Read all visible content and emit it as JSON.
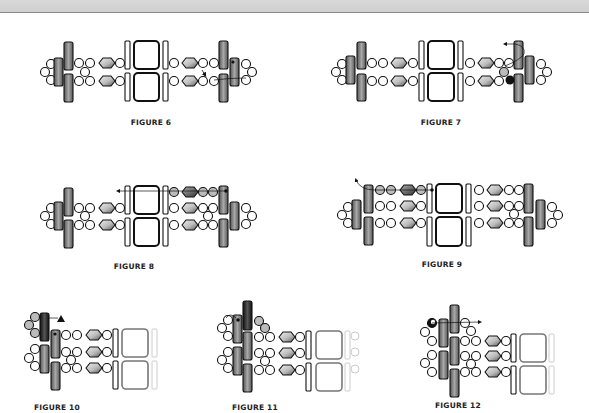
{
  "page": {
    "header_bar": "",
    "figures": [
      {
        "id": 6,
        "label": "FIGURE 6"
      },
      {
        "id": 7,
        "label": "FIGURE 7"
      },
      {
        "id": 8,
        "label": "FIGURE 8"
      },
      {
        "id": 9,
        "label": "FIGURE 9"
      },
      {
        "id": 10,
        "label": "FIGURE 10"
      },
      {
        "id": 11,
        "label": "FIGURE 11"
      },
      {
        "id": 12,
        "label": "FIGURE 12"
      }
    ]
  },
  "colors": {
    "bead_outline": "#111111",
    "tube_dark": "#4a4a4a",
    "tube_mid": "#8c8c8c",
    "highlight_tube": "#222222",
    "background": "#ffffff"
  }
}
